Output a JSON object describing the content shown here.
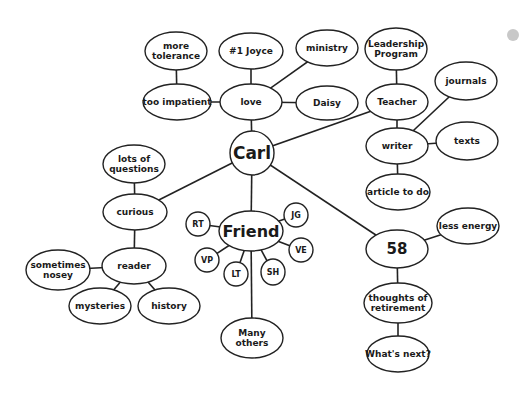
{
  "diagram": {
    "type": "mind-map",
    "central_node": "Carl",
    "nodes": [
      {
        "id": "carl",
        "label": [
          "Carl"
        ],
        "cx": 252,
        "cy": 153,
        "rx": 22,
        "ry": 22,
        "size": 17
      },
      {
        "id": "love",
        "label": [
          "love"
        ],
        "cx": 251,
        "cy": 102,
        "rx": 31,
        "ry": 18,
        "size": 9
      },
      {
        "id": "joyce",
        "label": [
          "#1 Joyce"
        ],
        "cx": 251,
        "cy": 51,
        "rx": 32,
        "ry": 18,
        "size": 9
      },
      {
        "id": "ministry",
        "label": [
          "ministry"
        ],
        "cx": 327,
        "cy": 48,
        "rx": 31,
        "ry": 18,
        "size": 9
      },
      {
        "id": "daisy",
        "label": [
          "Daisy"
        ],
        "cx": 327,
        "cy": 103,
        "rx": 31,
        "ry": 17,
        "size": 9
      },
      {
        "id": "impatient",
        "label": [
          "too impatient"
        ],
        "cx": 177,
        "cy": 102,
        "rx": 34,
        "ry": 18,
        "size": 9
      },
      {
        "id": "tolerance",
        "label": [
          "more",
          "tolerance"
        ],
        "cx": 176,
        "cy": 51,
        "rx": 31,
        "ry": 19,
        "size": 9
      },
      {
        "id": "teacher",
        "label": [
          "Teacher"
        ],
        "cx": 397,
        "cy": 102,
        "rx": 31,
        "ry": 18,
        "size": 9
      },
      {
        "id": "leadership",
        "label": [
          "Leadership",
          "Program"
        ],
        "cx": 396,
        "cy": 49,
        "rx": 31,
        "ry": 21,
        "size": 9
      },
      {
        "id": "writer",
        "label": [
          "writer"
        ],
        "cx": 397,
        "cy": 146,
        "rx": 31,
        "ry": 18,
        "size": 9
      },
      {
        "id": "journals",
        "label": [
          "journals"
        ],
        "cx": 466,
        "cy": 81,
        "rx": 31,
        "ry": 19,
        "size": 9
      },
      {
        "id": "texts",
        "label": [
          "texts"
        ],
        "cx": 467,
        "cy": 141,
        "rx": 31,
        "ry": 19,
        "size": 9
      },
      {
        "id": "article",
        "label": [
          "article to do"
        ],
        "cx": 398,
        "cy": 192,
        "rx": 32,
        "ry": 18,
        "size": 9
      },
      {
        "id": "curious",
        "label": [
          "curious"
        ],
        "cx": 135,
        "cy": 212,
        "rx": 32,
        "ry": 18,
        "size": 9
      },
      {
        "id": "questions",
        "label": [
          "lots of",
          "questions"
        ],
        "cx": 134,
        "cy": 164,
        "rx": 31,
        "ry": 19,
        "size": 9
      },
      {
        "id": "reader",
        "label": [
          "reader"
        ],
        "cx": 134,
        "cy": 266,
        "rx": 32,
        "ry": 18,
        "size": 9
      },
      {
        "id": "nosey",
        "label": [
          "sometimes",
          "nosey"
        ],
        "cx": 58,
        "cy": 270,
        "rx": 32,
        "ry": 20,
        "size": 9
      },
      {
        "id": "mysteries",
        "label": [
          "mysteries"
        ],
        "cx": 100,
        "cy": 306,
        "rx": 31,
        "ry": 18,
        "size": 9
      },
      {
        "id": "history",
        "label": [
          "history"
        ],
        "cx": 169,
        "cy": 306,
        "rx": 31,
        "ry": 18,
        "size": 9
      },
      {
        "id": "friend",
        "label": [
          "Friend"
        ],
        "cx": 251,
        "cy": 231,
        "rx": 32,
        "ry": 20,
        "size": 16
      },
      {
        "id": "rt",
        "label": [
          "RT"
        ],
        "cx": 198,
        "cy": 224,
        "rx": 12,
        "ry": 12,
        "size": 8
      },
      {
        "id": "vp",
        "label": [
          "VP"
        ],
        "cx": 207,
        "cy": 260,
        "rx": 12,
        "ry": 12,
        "size": 8
      },
      {
        "id": "lt",
        "label": [
          "LT"
        ],
        "cx": 236,
        "cy": 274,
        "rx": 12,
        "ry": 12,
        "size": 8
      },
      {
        "id": "sh",
        "label": [
          "SH"
        ],
        "cx": 273,
        "cy": 272,
        "rx": 12,
        "ry": 13,
        "size": 8
      },
      {
        "id": "jg",
        "label": [
          "JG"
        ],
        "cx": 296,
        "cy": 215,
        "rx": 12,
        "ry": 12,
        "size": 8
      },
      {
        "id": "ve",
        "label": [
          "VE"
        ],
        "cx": 301,
        "cy": 250,
        "rx": 12,
        "ry": 12,
        "size": 8
      },
      {
        "id": "others",
        "label": [
          "Many",
          "others"
        ],
        "cx": 252,
        "cy": 338,
        "rx": 31,
        "ry": 20,
        "size": 9
      },
      {
        "id": "age",
        "label": [
          "58"
        ],
        "cx": 397,
        "cy": 249,
        "rx": 31,
        "ry": 19,
        "size": 15
      },
      {
        "id": "energy",
        "label": [
          "less energy"
        ],
        "cx": 468,
        "cy": 226,
        "rx": 31,
        "ry": 18,
        "size": 9
      },
      {
        "id": "retirement",
        "label": [
          "thoughts of",
          "retirement"
        ],
        "cx": 398,
        "cy": 303,
        "rx": 34,
        "ry": 20,
        "size": 9
      },
      {
        "id": "next",
        "label": [
          "What's next?"
        ],
        "cx": 398,
        "cy": 354,
        "rx": 31,
        "ry": 18,
        "size": 9
      }
    ],
    "edges": [
      [
        "carl",
        "love"
      ],
      [
        "love",
        "joyce"
      ],
      [
        "love",
        "ministry"
      ],
      [
        "love",
        "daisy"
      ],
      [
        "love",
        "impatient"
      ],
      [
        "impatient",
        "tolerance"
      ],
      [
        "carl",
        "teacher"
      ],
      [
        "teacher",
        "leadership"
      ],
      [
        "teacher",
        "writer"
      ],
      [
        "writer",
        "journals"
      ],
      [
        "writer",
        "texts"
      ],
      [
        "writer",
        "article"
      ],
      [
        "carl",
        "curious"
      ],
      [
        "curious",
        "questions"
      ],
      [
        "curious",
        "reader"
      ],
      [
        "reader",
        "nosey"
      ],
      [
        "reader",
        "mysteries"
      ],
      [
        "reader",
        "history"
      ],
      [
        "carl",
        "friend"
      ],
      [
        "friend",
        "rt"
      ],
      [
        "friend",
        "vp"
      ],
      [
        "friend",
        "lt"
      ],
      [
        "friend",
        "sh"
      ],
      [
        "friend",
        "jg"
      ],
      [
        "friend",
        "ve"
      ],
      [
        "friend",
        "others"
      ],
      [
        "carl",
        "age"
      ],
      [
        "age",
        "energy"
      ],
      [
        "age",
        "retirement"
      ],
      [
        "retirement",
        "next"
      ]
    ],
    "decoration": {
      "dot": {
        "cx": 513,
        "cy": 35,
        "r": 6,
        "color": "#c8c8c8"
      }
    },
    "colors": {
      "stroke": "#222222",
      "text": "#1a1a1a",
      "background": "#ffffff"
    }
  }
}
